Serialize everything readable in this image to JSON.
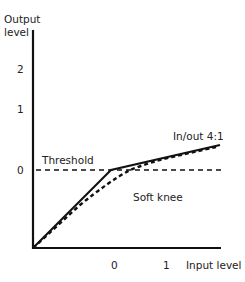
{
  "diagram": {
    "y_axis_label_line1": "Output",
    "y_axis_label_line2": "level",
    "x_axis_label": "Input level",
    "y_ticks": [
      "2",
      "1",
      "0"
    ],
    "x_ticks": [
      "0",
      "1"
    ],
    "threshold_label": "Threshold",
    "ratio_label": "In/out 4:1",
    "soft_knee_label": "Soft knee"
  }
}
